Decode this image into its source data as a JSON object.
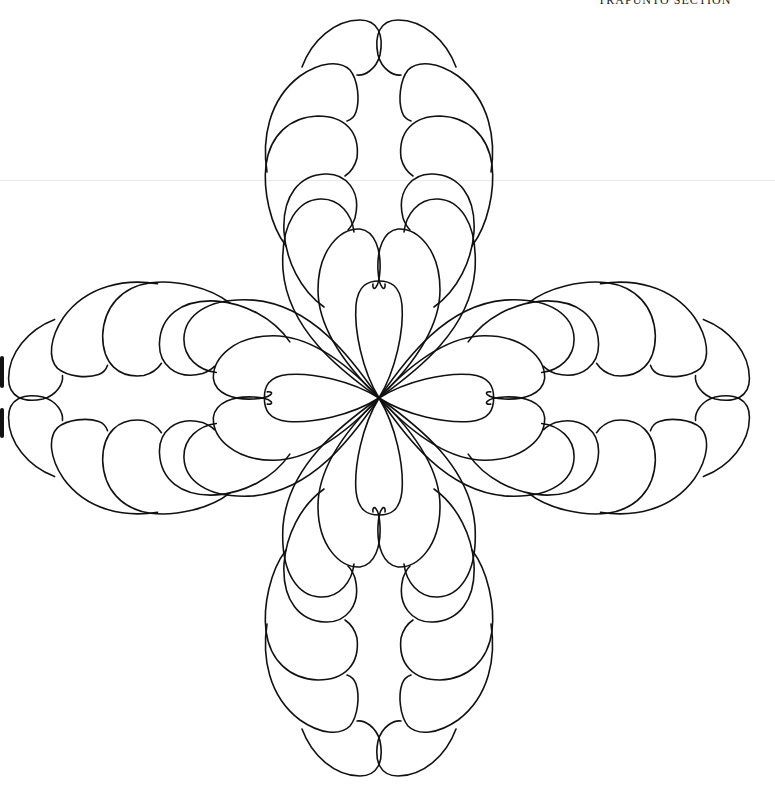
{
  "page": {
    "caption": "TRAPUNTO SECTION",
    "caption_note": "partially cropped at top edge"
  },
  "pattern": {
    "name": "four-arm feathered wreath",
    "arms": 4,
    "center": [
      379,
      398
    ],
    "stroke_color": "#111111",
    "background_color": "#ffffff",
    "feathers_per_side": 6,
    "central_petal_per_arm": 1
  }
}
